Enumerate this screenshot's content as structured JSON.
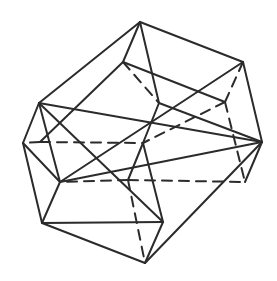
{
  "figure": {
    "title": "",
    "stroke_color": "#2b2b2b",
    "background": "#ffffff",
    "vertices": {
      "top": [
        140,
        22
      ],
      "upper_right": [
        243,
        62
      ],
      "inner_top": [
        123,
        62
      ],
      "center_top": [
        159,
        103
      ],
      "upper_left": [
        39,
        103
      ],
      "far_left": [
        23,
        143
      ],
      "center": [
        143,
        143
      ],
      "right": [
        262,
        142
      ],
      "mid_left": [
        60,
        182
      ],
      "inner_right": [
        245,
        182
      ],
      "inner_y": [
        128,
        180
      ],
      "inner_ur": [
        225,
        102
      ],
      "inner_l": [
        40,
        142
      ],
      "lower_left": [
        42,
        223
      ],
      "lower_center": [
        163,
        222
      ],
      "bottom": [
        145,
        263
      ]
    },
    "solid_edges": [
      [
        "top",
        "upper_right"
      ],
      [
        "top",
        "upper_left"
      ],
      [
        "top",
        "center_top"
      ],
      [
        "top",
        "inner_top"
      ],
      [
        "upper_right",
        "right"
      ],
      [
        "upper_right",
        "mid_left"
      ],
      [
        "upper_left",
        "far_left"
      ],
      [
        "upper_left",
        "lower_center"
      ],
      [
        "upper_left",
        "right"
      ],
      [
        "upper_left",
        "mid_left"
      ],
      [
        "center_top",
        "center"
      ],
      [
        "center_top",
        "right"
      ],
      [
        "far_left",
        "mid_left"
      ],
      [
        "far_left",
        "lower_left"
      ],
      [
        "mid_left",
        "lower_left"
      ],
      [
        "mid_left",
        "right"
      ],
      [
        "center",
        "lower_center"
      ],
      [
        "center",
        "inner_y"
      ],
      [
        "right",
        "inner_right"
      ],
      [
        "right",
        "bottom"
      ],
      [
        "lower_left",
        "bottom"
      ],
      [
        "lower_left",
        "lower_center"
      ],
      [
        "lower_center",
        "bottom"
      ],
      [
        "inner_top",
        "inner_ur"
      ],
      [
        "inner_top",
        "inner_l"
      ]
    ],
    "dashed_edges": [
      [
        "inner_top",
        "center_top"
      ],
      [
        "inner_ur",
        "upper_right"
      ],
      [
        "inner_ur",
        "inner_right"
      ],
      [
        "inner_ur",
        "center"
      ],
      [
        "inner_l",
        "far_left"
      ],
      [
        "inner_l",
        "center"
      ],
      [
        "inner_y",
        "inner_right"
      ],
      [
        "inner_y",
        "mid_left"
      ],
      [
        "inner_y",
        "bottom"
      ]
    ]
  }
}
